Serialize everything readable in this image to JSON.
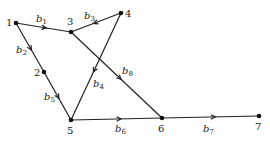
{
  "graph": {
    "nodes": [
      {
        "id": "1",
        "x": 16,
        "y": 23,
        "lx": 6,
        "ly": 26
      },
      {
        "id": "2",
        "x": 44,
        "y": 72,
        "lx": 34,
        "ly": 76
      },
      {
        "id": "3",
        "x": 71,
        "y": 32,
        "lx": 67,
        "ly": 25
      },
      {
        "id": "4",
        "x": 121,
        "y": 13,
        "lx": 125,
        "ly": 17
      },
      {
        "id": "5",
        "x": 71,
        "y": 120,
        "lx": 67,
        "ly": 134
      },
      {
        "id": "6",
        "x": 162,
        "y": 118,
        "lx": 158,
        "ly": 132
      },
      {
        "id": "7",
        "x": 259,
        "y": 116,
        "lx": 255,
        "ly": 130
      }
    ],
    "edges": [
      {
        "label": "b",
        "sub": "1",
        "from": "1",
        "to": "3",
        "lx": 36,
        "ly": 22
      },
      {
        "label": "b",
        "sub": "2",
        "from": "1",
        "to": "2",
        "lx": 16,
        "ly": 53
      },
      {
        "label": "b",
        "sub": "3",
        "from": "4",
        "to": "3",
        "lx": 84,
        "ly": 19
      },
      {
        "label": "b",
        "sub": "4",
        "from": "4",
        "to": "5",
        "lx": 93,
        "ly": 87
      },
      {
        "label": "b",
        "sub": "5",
        "from": "2",
        "to": "5",
        "lx": 44,
        "ly": 100
      },
      {
        "label": "b",
        "sub": "6",
        "from": "5",
        "to": "6",
        "lx": 115,
        "ly": 132
      },
      {
        "label": "b",
        "sub": "7",
        "from": "6",
        "to": "7",
        "lx": 203,
        "ly": 132
      },
      {
        "label": "b",
        "sub": "8",
        "from": "3",
        "to": "6",
        "lx": 122,
        "ly": 74
      }
    ]
  }
}
